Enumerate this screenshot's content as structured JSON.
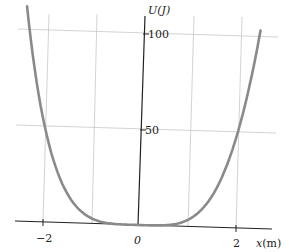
{
  "chart_data": {
    "type": "line",
    "title": "",
    "xlabel": "x(m)",
    "ylabel": "U(J)",
    "x_ticks": [
      "−2",
      "0",
      "2"
    ],
    "y_ticks": [
      "50",
      "100"
    ],
    "xlim": [
      -2.5,
      2.5
    ],
    "ylim": [
      0,
      100
    ],
    "grid": true,
    "series": [
      {
        "name": "U(x)",
        "color": "#808080",
        "x": [
          -2.45,
          -2.25,
          -2.0,
          -1.75,
          -1.5,
          -1.25,
          -1.0,
          -0.75,
          -0.5,
          -0.25,
          0,
          0.25,
          0.5,
          0.75,
          1.0,
          1.25,
          1.5,
          1.75,
          2.0,
          2.25,
          2.4
        ],
        "y": [
          100,
          80,
          50,
          29.3,
          15.8,
          7.6,
          3.1,
          1.0,
          0.2,
          0.0,
          0,
          0.0,
          0.2,
          1.0,
          3.1,
          7.6,
          15.8,
          29.3,
          50,
          80,
          100
        ]
      }
    ]
  }
}
